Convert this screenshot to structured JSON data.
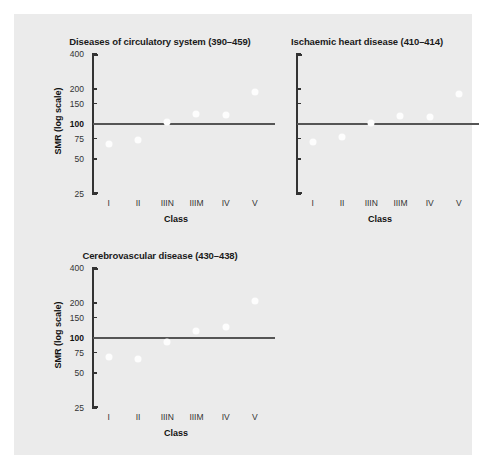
{
  "chart_data": {
    "type": "scatter",
    "title": "",
    "xlabel": "Class",
    "ylabel": "SMR (log scale)",
    "ylim": [
      25,
      400
    ],
    "yscale": "log",
    "grid": false,
    "legend": "none",
    "categories": [
      "I",
      "II",
      "IIIN",
      "IIIM",
      "IV",
      "V"
    ],
    "ytick_labels": [
      "400",
      "200",
      "150",
      "100",
      "75",
      "50",
      "25"
    ],
    "ytick_values": [
      400,
      200,
      150,
      100,
      75,
      50,
      25
    ],
    "reference_line": 100,
    "panels": [
      {
        "title": "Diseases of circulatory system (390–459)",
        "show_y_labels": true,
        "values": [
          67,
          73,
          104,
          121,
          120,
          190
        ]
      },
      {
        "title": "Ischaemic heart disease (410–414)",
        "show_y_labels": false,
        "values": [
          70,
          78,
          103,
          117,
          115,
          182
        ]
      },
      {
        "title": "Cerebrovascular disease (430–438)",
        "show_y_labels": true,
        "values": [
          69,
          66,
          92,
          116,
          124,
          208
        ]
      }
    ]
  },
  "colors": {
    "canvas_background": "#ebebeb",
    "page_background": "#ffffff",
    "marker": "#fdfdfd",
    "axis": "#333333",
    "reference_line": "#555555",
    "title_text": "#1a1a1a"
  }
}
